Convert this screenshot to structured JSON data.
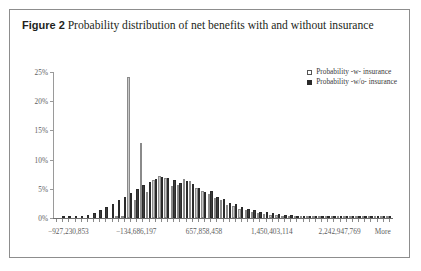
{
  "figure": {
    "label": "Figure 2",
    "caption": "Probability distribution of net benefits with and without insurance"
  },
  "legend": {
    "position": "top-right",
    "entries": [
      {
        "label": "Probability -w- insurance",
        "swatch": "hollow-square",
        "color": "#c9c9c9"
      },
      {
        "label": "Probability -w/o- insurance",
        "swatch": "filled-square",
        "color": "#3b3b3b"
      }
    ]
  },
  "chart_data": {
    "type": "bar",
    "title": "Probability distribution of net benefits with and without insurance",
    "xlabel": "",
    "ylabel": "",
    "grid": false,
    "legend_position": "top-right",
    "ylim": [
      0,
      25
    ],
    "ytick_labels": [
      "0%",
      "5%",
      "10%",
      "15%",
      "20%",
      "25%"
    ],
    "ytick_values": [
      0,
      5,
      10,
      15,
      20,
      25
    ],
    "xtick_labels": [
      "−927,230,853",
      "−134,686,197",
      "657,858,458",
      "1,450,403,114",
      "2,242,947,769",
      "More"
    ],
    "xtick_positions": [
      2,
      13,
      24,
      35,
      46,
      53
    ],
    "n_bins": 55,
    "series": [
      {
        "name": "Probability -w- insurance",
        "color": "#c9c9c9",
        "values": [
          0,
          0,
          0,
          0,
          0,
          0,
          0,
          0,
          0,
          0,
          0.2,
          0.4,
          24.2,
          3.0,
          12.9,
          4.5,
          6.5,
          7.2,
          6.8,
          5.4,
          5.6,
          6.6,
          6.3,
          5.2,
          4.6,
          4.1,
          3.4,
          3.0,
          2.3,
          2.0,
          1.6,
          1.3,
          1.1,
          0.9,
          0.7,
          0.6,
          0.5,
          0.4,
          0.35,
          0.3,
          0.25,
          0.2,
          0.18,
          0.15,
          0.12,
          0.1,
          0.09,
          0.08,
          0.07,
          0.06,
          0.05,
          0.05,
          0.04,
          0.04,
          0.3
        ]
      },
      {
        "name": "Probability -w/o- insurance",
        "color": "#3b3b3b",
        "values": [
          0,
          0.05,
          0.1,
          0.2,
          0.35,
          0.6,
          0.9,
          1.4,
          1.9,
          2.4,
          3.0,
          3.6,
          4.3,
          5.0,
          5.6,
          6.1,
          6.6,
          7.0,
          6.9,
          6.5,
          6.0,
          6.4,
          5.9,
          5.1,
          4.4,
          4.7,
          3.6,
          3.2,
          2.6,
          2.4,
          1.9,
          1.6,
          1.3,
          1.1,
          0.95,
          0.8,
          0.65,
          0.55,
          0.45,
          0.38,
          0.3,
          0.26,
          0.22,
          0.18,
          0.15,
          0.13,
          0.11,
          0.09,
          0.08,
          0.07,
          0.06,
          0.05,
          0.05,
          0.04,
          0.25
        ]
      }
    ]
  }
}
